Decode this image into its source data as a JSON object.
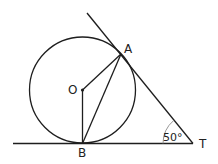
{
  "diagram": {
    "type": "geometry",
    "colors": {
      "stroke": "#1e1e1e",
      "arc": "#8a8a8a",
      "text": "#222222"
    },
    "circle": {
      "center_label": "O",
      "cx": 82.5,
      "cy": 90,
      "r": 53
    },
    "points": {
      "O": {
        "label": "O",
        "x": 82.5,
        "y": 90
      },
      "A": {
        "label": "A",
        "x": 121,
        "y": 54
      },
      "B": {
        "label": "B",
        "x": 82.5,
        "y": 143.5
      },
      "T": {
        "label": "T",
        "x": 193,
        "y": 143.5
      }
    },
    "segments": [
      "OA",
      "OB",
      "AB",
      "tangent TA (extended)",
      "tangent TB (extended)"
    ],
    "angle": {
      "vertex": "T",
      "label": "50°",
      "value_deg": 50
    }
  }
}
